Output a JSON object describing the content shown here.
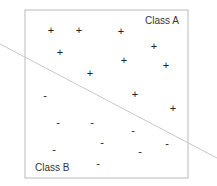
{
  "diagram": {
    "class_a_label": "Class A",
    "class_b_label": "Class B",
    "plus_symbol": "+",
    "minus_symbol": "-",
    "colors": {
      "border": "#bbbbbb",
      "line": "#c8c8c8",
      "marks": "#222222",
      "text": "#333333"
    },
    "class_a_points": [
      [
        51,
        30
      ],
      [
        79,
        30
      ],
      [
        121,
        31
      ],
      [
        154,
        46
      ],
      [
        60,
        52
      ],
      [
        124,
        60
      ],
      [
        166,
        65
      ],
      [
        90,
        73
      ],
      [
        135,
        94
      ],
      [
        173,
        108
      ]
    ],
    "class_b_points": [
      [
        45,
        95
      ],
      [
        58,
        122
      ],
      [
        92,
        122
      ],
      [
        133,
        130
      ],
      [
        102,
        142
      ],
      [
        167,
        143
      ],
      [
        54,
        149
      ],
      [
        140,
        151
      ],
      [
        98,
        163
      ]
    ],
    "decision_boundary": {
      "x1": 0,
      "y1": 44,
      "x2": 217,
      "y2": 158
    }
  }
}
